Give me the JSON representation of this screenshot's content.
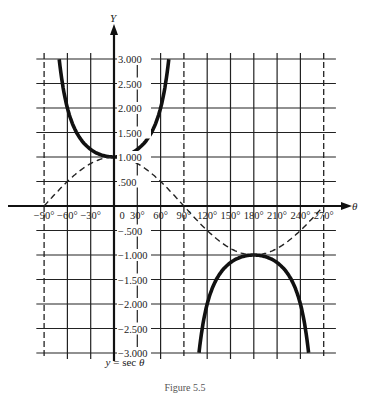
{
  "chart_data": {
    "type": "line",
    "title": "y = sec θ",
    "caption": "Figure 5.5",
    "xlabel": "θ",
    "ylabel": "Y",
    "x_unit": "degrees",
    "xlim": [
      -90,
      270
    ],
    "ylim": [
      -3.0,
      3.0
    ],
    "grid": true,
    "x_ticks": [
      "-90°",
      "-60°",
      "-30°",
      "0",
      "30°",
      "60°",
      "90°",
      "120°",
      "150°",
      "180°",
      "210°",
      "240°",
      "270°"
    ],
    "x_tick_values": [
      -90,
      -60,
      -30,
      0,
      30,
      60,
      90,
      120,
      150,
      180,
      210,
      240,
      270
    ],
    "y_ticks": [
      "3.000",
      "2.500",
      "2.000",
      "1.500",
      "1.000",
      ".500",
      "-.500",
      "-1.000",
      "-1.500",
      "-2.000",
      "-2.500",
      "-3.000"
    ],
    "y_tick_values": [
      3.0,
      2.5,
      2.0,
      1.5,
      1.0,
      0.5,
      -0.5,
      -1.0,
      -1.5,
      -2.0,
      -2.5,
      -3.0
    ],
    "asymptotes": [
      -90,
      90,
      270
    ],
    "series": [
      {
        "name": "y = sec θ",
        "style": "solid-thick",
        "segments": [
          {
            "x": [
              -70.5,
              -60,
              -45,
              -30,
              -15,
              0,
              15,
              30,
              45,
              60,
              70.5
            ],
            "y": [
              3.0,
              2.0,
              1.414,
              1.155,
              1.035,
              1.0,
              1.035,
              1.155,
              1.414,
              2.0,
              3.0
            ]
          },
          {
            "x": [
              109.5,
              120,
              135,
              150,
              165,
              180,
              195,
              210,
              225,
              240,
              250.5
            ],
            "y": [
              -3.0,
              -2.0,
              -1.414,
              -1.155,
              -1.035,
              -1.0,
              -1.035,
              -1.155,
              -1.414,
              -2.0,
              -3.0
            ]
          }
        ]
      },
      {
        "name": "y = cos θ",
        "style": "dashed",
        "segments": [
          {
            "x": [
              -90,
              -60,
              -30,
              0,
              30,
              60,
              90,
              120,
              150,
              180,
              210,
              240,
              270
            ],
            "y": [
              0,
              0.5,
              0.866,
              1.0,
              0.866,
              0.5,
              0,
              -0.5,
              -0.866,
              -1.0,
              -0.866,
              -0.5,
              0
            ]
          }
        ]
      }
    ]
  },
  "labels": {
    "y_axis": "Y",
    "x_axis": "θ",
    "formula_prefix": "y",
    "formula_eq": " = sec ",
    "formula_var": "θ",
    "figure": "Figure 5.5"
  }
}
